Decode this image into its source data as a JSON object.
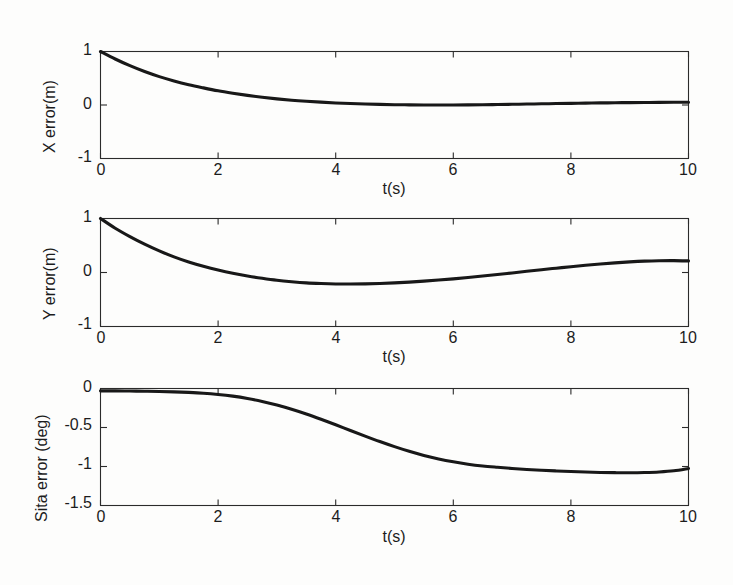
{
  "figure": {
    "background_color": "#fdfdfc",
    "curve_color": "#181818",
    "axis_color": "#2b2b2b"
  },
  "chart_data": [
    {
      "type": "line",
      "title": "",
      "xlabel": "t(s)",
      "ylabel": "X error(m)",
      "xlim": [
        0,
        10
      ],
      "ylim": [
        -1,
        1
      ],
      "xticks": [
        0,
        2,
        4,
        6,
        8,
        10
      ],
      "xticklabels": [
        "0",
        "2",
        "4",
        "6",
        "8",
        "10"
      ],
      "yticks": [
        -1,
        0,
        1
      ],
      "yticklabels": [
        "-1",
        "0",
        "1"
      ],
      "grid": false,
      "legend": "none",
      "x": [
        0,
        0.25,
        0.5,
        0.75,
        1.0,
        1.25,
        1.5,
        1.75,
        2.0,
        2.25,
        2.5,
        2.75,
        3.0,
        3.25,
        3.5,
        3.75,
        4.0,
        4.25,
        4.5,
        4.75,
        5.0,
        5.25,
        5.5,
        5.75,
        6.0,
        6.25,
        6.5,
        6.75,
        7.0,
        7.25,
        7.5,
        7.75,
        8.0,
        8.25,
        8.5,
        8.75,
        9.0,
        9.25,
        9.5,
        9.75,
        10.0
      ],
      "values": [
        1.0,
        0.86,
        0.735,
        0.625,
        0.53,
        0.45,
        0.38,
        0.32,
        0.265,
        0.22,
        0.18,
        0.145,
        0.115,
        0.09,
        0.07,
        0.053,
        0.038,
        0.027,
        0.018,
        0.011,
        0.006,
        0.003,
        0.001,
        0.0,
        0.0,
        0.002,
        0.005,
        0.009,
        0.013,
        0.018,
        0.022,
        0.027,
        0.031,
        0.035,
        0.039,
        0.042,
        0.045,
        0.047,
        0.049,
        0.05,
        0.05
      ]
    },
    {
      "type": "line",
      "title": "",
      "xlabel": "t(s)",
      "ylabel": "Y error(m)",
      "xlim": [
        0,
        10
      ],
      "ylim": [
        -1,
        1
      ],
      "xticks": [
        0,
        2,
        4,
        6,
        8,
        10
      ],
      "xticklabels": [
        "0",
        "2",
        "4",
        "6",
        "8",
        "10"
      ],
      "yticks": [
        -1,
        0,
        1
      ],
      "yticklabels": [
        "-1",
        "0",
        "1"
      ],
      "grid": false,
      "legend": "none",
      "x": [
        0,
        0.25,
        0.5,
        0.75,
        1.0,
        1.25,
        1.5,
        1.75,
        2.0,
        2.25,
        2.5,
        2.75,
        3.0,
        3.25,
        3.5,
        3.75,
        4.0,
        4.25,
        4.5,
        4.75,
        5.0,
        5.25,
        5.5,
        5.75,
        6.0,
        6.25,
        6.5,
        6.75,
        7.0,
        7.25,
        7.5,
        7.75,
        8.0,
        8.25,
        8.5,
        8.75,
        9.0,
        9.25,
        9.5,
        9.75,
        10.0
      ],
      "values": [
        1.0,
        0.82,
        0.665,
        0.525,
        0.4,
        0.29,
        0.195,
        0.115,
        0.045,
        -0.015,
        -0.065,
        -0.108,
        -0.145,
        -0.172,
        -0.193,
        -0.205,
        -0.212,
        -0.213,
        -0.21,
        -0.203,
        -0.192,
        -0.178,
        -0.16,
        -0.14,
        -0.118,
        -0.093,
        -0.066,
        -0.038,
        -0.008,
        0.022,
        0.052,
        0.08,
        0.108,
        0.134,
        0.157,
        0.178,
        0.196,
        0.21,
        0.218,
        0.22,
        0.215
      ]
    },
    {
      "type": "line",
      "title": "",
      "xlabel": "t(s)",
      "ylabel": "Sita error (deg)",
      "xlim": [
        0,
        10
      ],
      "ylim": [
        -1.5,
        0
      ],
      "xticks": [
        0,
        2,
        4,
        6,
        8,
        10
      ],
      "xticklabels": [
        "0",
        "2",
        "4",
        "6",
        "8",
        "10"
      ],
      "yticks": [
        -1.5,
        -1,
        -0.5,
        0
      ],
      "yticklabels": [
        "-1.5",
        "-1",
        "-0.5",
        "0"
      ],
      "grid": false,
      "legend": "none",
      "x": [
        0,
        0.25,
        0.5,
        0.75,
        1.0,
        1.25,
        1.5,
        1.75,
        2.0,
        2.25,
        2.5,
        2.75,
        3.0,
        3.25,
        3.5,
        3.75,
        4.0,
        4.25,
        4.5,
        4.75,
        5.0,
        5.25,
        5.5,
        5.75,
        6.0,
        6.25,
        6.5,
        6.75,
        7.0,
        7.25,
        7.5,
        7.75,
        8.0,
        8.25,
        8.5,
        8.75,
        9.0,
        9.25,
        9.5,
        9.75,
        10.0
      ],
      "values": [
        -0.03,
        -0.031,
        -0.033,
        -0.035,
        -0.038,
        -0.043,
        -0.05,
        -0.06,
        -0.076,
        -0.098,
        -0.128,
        -0.166,
        -0.212,
        -0.266,
        -0.327,
        -0.394,
        -0.465,
        -0.538,
        -0.61,
        -0.68,
        -0.745,
        -0.805,
        -0.858,
        -0.903,
        -0.94,
        -0.97,
        -0.993,
        -1.01,
        -1.025,
        -1.038,
        -1.048,
        -1.057,
        -1.065,
        -1.071,
        -1.076,
        -1.079,
        -1.08,
        -1.077,
        -1.07,
        -1.055,
        -1.025
      ]
    }
  ]
}
